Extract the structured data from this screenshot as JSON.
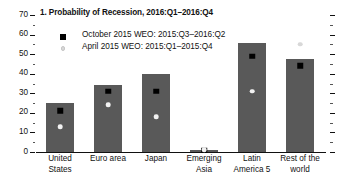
{
  "chart_data": {
    "type": "bar",
    "title": "1. Probability of Recession, 2016:Q1–2016:Q4",
    "xlabel": "",
    "ylabel": "",
    "ylim": [
      0,
      70
    ],
    "ytick_step": 10,
    "yminor_step": 5,
    "grid": false,
    "legend_position": "upper-left",
    "categories": [
      "United\nStates",
      "Euro area",
      "Japan",
      "Emerging\nAsia",
      "Latin\nAmerica 5",
      "Rest of the\nworld"
    ],
    "ytick_labels": [
      "0",
      "10",
      "20",
      "30",
      "40",
      "50",
      "60",
      "70"
    ],
    "ytick_values": [
      0,
      10,
      20,
      30,
      40,
      50,
      60,
      70
    ],
    "bar_series": {
      "name": "October 2015 WEO: 2015:Q3–2016:Q2",
      "values": [
        25,
        34,
        40,
        1,
        55.5,
        47.5
      ]
    },
    "series": [
      {
        "name": "October 2015 WEO: 2015:Q3–2016:Q2",
        "marker": "black-square",
        "values": [
          21,
          31,
          31,
          1,
          49,
          44
        ]
      },
      {
        "name": "April 2015 WEO: 2015:Q1–2015:Q4",
        "marker": "white-dot",
        "values": [
          13,
          24,
          18,
          1,
          31,
          55
        ]
      }
    ],
    "colors": {
      "bar": "#595959",
      "october_marker": "#000000",
      "april_marker": "#f2f2f2",
      "axis": "#111111",
      "background": "#ffffff"
    }
  },
  "legend": {
    "entries": [
      {
        "label": "October 2015 WEO: 2015:Q3–2016:Q2",
        "icon": "black-square-marker"
      },
      {
        "label": "April 2015 WEO: 2015:Q1–2015:Q4",
        "icon": "white-dot-marker"
      }
    ]
  }
}
